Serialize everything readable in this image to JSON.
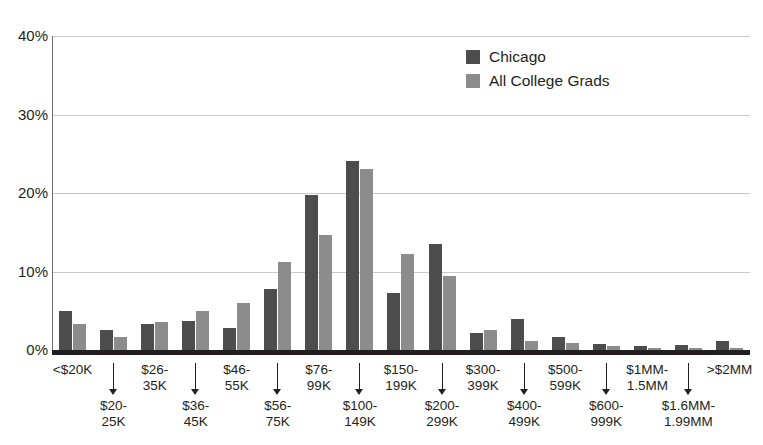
{
  "chart_data": {
    "type": "bar",
    "title": "",
    "subtitle": "",
    "xlabel": "",
    "ylabel": "",
    "ylim": [
      0,
      40
    ],
    "y_ticks": [
      "0%",
      "10%",
      "20%",
      "30%",
      "40%"
    ],
    "y_tick_values": [
      0,
      10,
      20,
      30,
      40
    ],
    "grid": "horizontal",
    "legend_position": "top-right",
    "categories": [
      "<$20K",
      "$20-\n25K",
      "$26-\n35K",
      "$36-\n45K",
      "$46-\n55K",
      "$56-\n75K",
      "$76-\n99K",
      "$100-\n149K",
      "$150-\n199K",
      "$200-\n299K",
      "$300-\n399K",
      "$400-\n499K",
      "$500-\n599K",
      "$600-\n999K",
      "$1MM-\n1.5MM",
      "$1.6MM-\n1.99MM",
      ">$2MM"
    ],
    "series": [
      {
        "name": "Chicago",
        "color": "#4d4d4d",
        "values": [
          5.0,
          2.6,
          3.3,
          3.7,
          2.8,
          7.8,
          19.7,
          24.1,
          7.3,
          13.5,
          2.2,
          3.9,
          1.7,
          0.8,
          0.5,
          0.6,
          1.1
        ]
      },
      {
        "name": "All College Grads",
        "color": "#8c8c8c",
        "values": [
          3.3,
          1.7,
          3.6,
          5.0,
          6.0,
          11.2,
          14.7,
          23.0,
          12.2,
          9.4,
          2.6,
          1.1,
          0.9,
          0.5,
          0.3,
          0.2,
          0.2
        ]
      }
    ]
  },
  "legend": {
    "items": [
      {
        "label": "Chicago",
        "color": "#4d4d4d"
      },
      {
        "label": "All College Grads",
        "color": "#8c8c8c"
      }
    ]
  },
  "axis": {
    "y_ticks": [
      "40%",
      "30%",
      "20%",
      "10%",
      "0%"
    ]
  },
  "colors": {
    "chicago": "#4d4d4d",
    "all_college_grads": "#8c8c8c",
    "gridline": "#c9c9c9",
    "axis": "#231f20",
    "background": "#ffffff"
  }
}
